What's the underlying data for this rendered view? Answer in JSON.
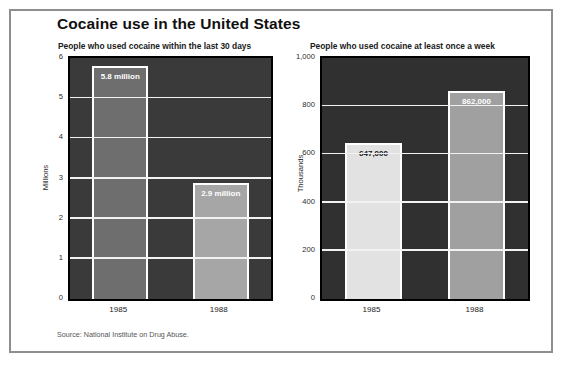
{
  "page": {
    "title": "Cocaine use in the United States",
    "source_note": "Source: National Institute on Drug Abuse.",
    "border_color": "#8e8e8e",
    "background": "#ffffff"
  },
  "chart_data": [
    {
      "type": "bar",
      "id": "last-30-days",
      "title": "People who used cocaine within the last 30 days",
      "xlabel": "",
      "ylabel": "Millions",
      "categories": [
        "1985",
        "1988"
      ],
      "values": [
        5.8,
        2.9
      ],
      "data_labels": [
        "5.8 million",
        "2.9 million"
      ],
      "ylim": [
        0,
        6
      ],
      "yticks": [
        0,
        1,
        2,
        3,
        4,
        5,
        6
      ],
      "ytick_labels": [
        "0",
        "1",
        "2",
        "3",
        "4",
        "5",
        "6"
      ],
      "grid": true,
      "legend": "none",
      "plot_background": "#3a3a3a",
      "gridline_color": "#f2f2f2",
      "bar_colors": [
        "#6e6e6e",
        "#a6a6a6"
      ],
      "bar_outline": "#ffffff",
      "label_colors": [
        "light",
        "light"
      ]
    },
    {
      "type": "bar",
      "id": "once-a-week",
      "title": "People who used cocaine at least once a week",
      "xlabel": "",
      "ylabel": "Thousands",
      "categories": [
        "1985",
        "1988"
      ],
      "values": [
        647,
        862
      ],
      "data_labels": [
        "647,000",
        "862,000"
      ],
      "ylim": [
        0,
        1000
      ],
      "yticks": [
        0,
        200,
        400,
        600,
        800,
        1000
      ],
      "ytick_labels": [
        "0",
        "200",
        "400",
        "600",
        "800",
        "1,000"
      ],
      "grid": true,
      "legend": "none",
      "plot_background": "#303030",
      "gridline_color": "#f2f2f2",
      "bar_colors": [
        "#e2e2e2",
        "#a0a0a0"
      ],
      "bar_outline": "#ffffff",
      "label_colors": [
        "dark",
        "light"
      ]
    }
  ]
}
